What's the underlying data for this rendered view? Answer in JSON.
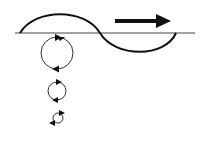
{
  "diagram": {
    "colors": {
      "background": "#ffffff",
      "stroke": "#111111",
      "baseline": "#444444"
    },
    "baseline": {
      "x1": 15,
      "x2": 195,
      "y": 33
    },
    "wave": {
      "path": "M20 33 C 35 8, 85 8, 100 33 S 165 58, 176 33"
    },
    "propagation_arrow": {
      "x1": 115,
      "x2": 170,
      "y": 21,
      "direction": "right"
    },
    "orbits": [
      {
        "label": "surface orbit",
        "cx": 57,
        "cy": 53,
        "r": 16
      },
      {
        "label": "mid-depth orbit",
        "cx": 57,
        "cy": 91,
        "r": 9
      },
      {
        "label": "deep orbit",
        "cx": 58,
        "cy": 118,
        "r": 5
      }
    ]
  }
}
